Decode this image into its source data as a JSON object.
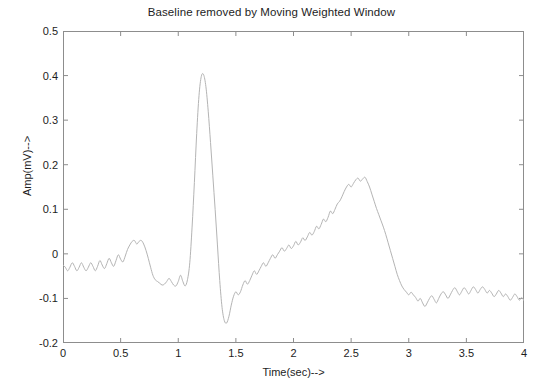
{
  "chart_data": {
    "type": "line",
    "title": "Baseline removed by Moving Weighted Window",
    "xlabel": "Time(sec)-->",
    "ylabel": "Amp(mV)-->",
    "xlim": [
      0,
      4
    ],
    "ylim": [
      -0.2,
      0.5
    ],
    "xticks": [
      0,
      0.5,
      1,
      1.5,
      2,
      2.5,
      3,
      3.5,
      4
    ],
    "xtick_labels": [
      "0",
      "0.5",
      "1",
      "1.5",
      "2",
      "2.5",
      "3",
      "3.5",
      "4"
    ],
    "yticks": [
      -0.2,
      -0.1,
      0,
      0.1,
      0.2,
      0.3,
      0.4,
      0.5
    ],
    "ytick_labels": [
      "-0.2",
      "-0.1",
      "0",
      "0.1",
      "0.2",
      "0.3",
      "0.4",
      "0.5"
    ],
    "grid": false,
    "legend": null,
    "line_color": "#b4b4b4",
    "axis_color": "#8d8d8d",
    "background": "#ffffff",
    "series": [
      {
        "name": "ECG baseline removed",
        "x": [
          0.0,
          0.02,
          0.04,
          0.06,
          0.08,
          0.1,
          0.12,
          0.14,
          0.16,
          0.18,
          0.2,
          0.22,
          0.24,
          0.26,
          0.28,
          0.3,
          0.32,
          0.34,
          0.36,
          0.38,
          0.4,
          0.42,
          0.44,
          0.46,
          0.48,
          0.5,
          0.52,
          0.54,
          0.56,
          0.58,
          0.6,
          0.62,
          0.64,
          0.66,
          0.68,
          0.7,
          0.72,
          0.74,
          0.76,
          0.78,
          0.8,
          0.82,
          0.84,
          0.86,
          0.88,
          0.9,
          0.92,
          0.94,
          0.96,
          0.98,
          1.0,
          1.02,
          1.04,
          1.06,
          1.08,
          1.1,
          1.12,
          1.14,
          1.16,
          1.18,
          1.2,
          1.22,
          1.24,
          1.26,
          1.28,
          1.3,
          1.32,
          1.34,
          1.36,
          1.38,
          1.4,
          1.42,
          1.44,
          1.46,
          1.48,
          1.5,
          1.52,
          1.54,
          1.56,
          1.58,
          1.6,
          1.62,
          1.64,
          1.66,
          1.68,
          1.7,
          1.72,
          1.74,
          1.76,
          1.78,
          1.8,
          1.82,
          1.84,
          1.86,
          1.88,
          1.9,
          1.92,
          1.94,
          1.96,
          1.98,
          2.0,
          2.02,
          2.04,
          2.06,
          2.08,
          2.1,
          2.12,
          2.14,
          2.16,
          2.18,
          2.2,
          2.22,
          2.24,
          2.26,
          2.28,
          2.3,
          2.32,
          2.34,
          2.36,
          2.38,
          2.4,
          2.42,
          2.44,
          2.46,
          2.48,
          2.5,
          2.52,
          2.54,
          2.56,
          2.58,
          2.6,
          2.62,
          2.64,
          2.66,
          2.68,
          2.7,
          2.72,
          2.74,
          2.76,
          2.78,
          2.8,
          2.82,
          2.84,
          2.86,
          2.88,
          2.9,
          2.92,
          2.94,
          2.96,
          2.98,
          3.0,
          3.02,
          3.04,
          3.06,
          3.08,
          3.1,
          3.12,
          3.14,
          3.16,
          3.18,
          3.2,
          3.22,
          3.24,
          3.26,
          3.28,
          3.3,
          3.32,
          3.34,
          3.36,
          3.38,
          3.4,
          3.42,
          3.44,
          3.46,
          3.48,
          3.5,
          3.52,
          3.54,
          3.56,
          3.58,
          3.6,
          3.62,
          3.64,
          3.66,
          3.68,
          3.7,
          3.72,
          3.74,
          3.76,
          3.78,
          3.8,
          3.82,
          3.84,
          3.86,
          3.88,
          3.9,
          3.92,
          3.94,
          3.96,
          3.98,
          4.0
        ],
        "y": [
          -0.025,
          -0.03,
          -0.038,
          -0.03,
          -0.02,
          -0.028,
          -0.038,
          -0.03,
          -0.02,
          -0.03,
          -0.038,
          -0.03,
          -0.02,
          -0.028,
          -0.038,
          -0.028,
          -0.015,
          -0.025,
          -0.033,
          -0.022,
          -0.01,
          -0.02,
          -0.028,
          -0.015,
          -0.002,
          -0.012,
          -0.018,
          -0.005,
          0.01,
          0.02,
          0.028,
          0.03,
          0.022,
          0.028,
          0.03,
          0.022,
          0.008,
          -0.01,
          -0.03,
          -0.048,
          -0.058,
          -0.062,
          -0.066,
          -0.07,
          -0.068,
          -0.062,
          -0.055,
          -0.062,
          -0.07,
          -0.072,
          -0.062,
          -0.048,
          -0.062,
          -0.072,
          -0.058,
          -0.02,
          0.06,
          0.16,
          0.27,
          0.355,
          0.398,
          0.402,
          0.375,
          0.32,
          0.25,
          0.175,
          0.1,
          0.02,
          -0.06,
          -0.12,
          -0.15,
          -0.155,
          -0.14,
          -0.115,
          -0.095,
          -0.085,
          -0.092,
          -0.085,
          -0.07,
          -0.06,
          -0.068,
          -0.06,
          -0.048,
          -0.038,
          -0.046,
          -0.038,
          -0.028,
          -0.02,
          -0.028,
          -0.02,
          -0.01,
          -0.002,
          -0.01,
          -0.002,
          0.006,
          0.014,
          0.006,
          0.012,
          0.02,
          0.012,
          0.018,
          0.028,
          0.02,
          0.026,
          0.036,
          0.03,
          0.038,
          0.048,
          0.042,
          0.05,
          0.062,
          0.056,
          0.066,
          0.078,
          0.072,
          0.082,
          0.096,
          0.09,
          0.1,
          0.112,
          0.118,
          0.128,
          0.14,
          0.15,
          0.156,
          0.15,
          0.158,
          0.166,
          0.17,
          0.163,
          0.168,
          0.172,
          0.162,
          0.15,
          0.134,
          0.118,
          0.102,
          0.088,
          0.074,
          0.06,
          0.044,
          0.026,
          0.008,
          -0.01,
          -0.028,
          -0.046,
          -0.06,
          -0.072,
          -0.08,
          -0.086,
          -0.092,
          -0.086,
          -0.092,
          -0.098,
          -0.106,
          -0.1,
          -0.11,
          -0.118,
          -0.11,
          -0.1,
          -0.094,
          -0.102,
          -0.11,
          -0.1,
          -0.09,
          -0.085,
          -0.092,
          -0.1,
          -0.092,
          -0.082,
          -0.076,
          -0.084,
          -0.092,
          -0.084,
          -0.076,
          -0.082,
          -0.09,
          -0.082,
          -0.074,
          -0.08,
          -0.088,
          -0.08,
          -0.074,
          -0.08,
          -0.088,
          -0.082,
          -0.088,
          -0.096,
          -0.09,
          -0.082,
          -0.088,
          -0.096,
          -0.09,
          -0.096,
          -0.104,
          -0.098,
          -0.09,
          -0.096,
          -0.104,
          -0.098,
          -0.105
        ]
      }
    ]
  }
}
